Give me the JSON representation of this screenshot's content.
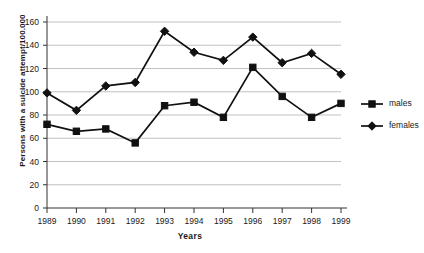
{
  "chart_data": {
    "type": "line",
    "title": "",
    "xlabel": "Years",
    "ylabel": "Persons with a suicide attempt/100.000",
    "categories": [
      "1989",
      "1990",
      "1991",
      "1992",
      "1993",
      "1994",
      "1995",
      "1996",
      "1997",
      "1998",
      "1999"
    ],
    "series": [
      {
        "name": "males",
        "marker": "square",
        "color": "#111111",
        "values": [
          72,
          66,
          68,
          56,
          88,
          91,
          78,
          121,
          96,
          78,
          90
        ]
      },
      {
        "name": "females",
        "marker": "diamond",
        "color": "#111111",
        "values": [
          99,
          84,
          105,
          108,
          152,
          134,
          127,
          147,
          125,
          133,
          115
        ]
      }
    ],
    "ylim": [
      0,
      160
    ],
    "ytick_step": 20,
    "yticks": [
      "0",
      "20",
      "40",
      "60",
      "80",
      "100",
      "120",
      "140",
      "160"
    ],
    "grid": true,
    "grid_axis": "y",
    "legend_position": "right"
  },
  "legend": {
    "entries": [
      {
        "label": "males"
      },
      {
        "label": "females"
      }
    ]
  }
}
